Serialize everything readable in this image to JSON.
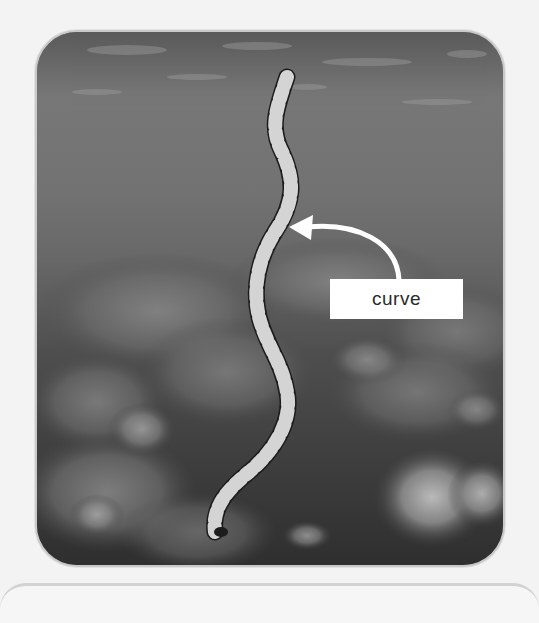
{
  "image": {
    "subject": "banded sea snake swimming over coral reef (grayscale underwater photo)",
    "annotation": {
      "label": "curve",
      "arrow_icon": "curved-arrow-left-icon"
    }
  },
  "colors": {
    "page_background": "#f3f3f3",
    "frame_border": "#c9c9c9",
    "label_background": "#ffffff",
    "label_text": "#2a2a2a",
    "arrow": "#ffffff"
  }
}
